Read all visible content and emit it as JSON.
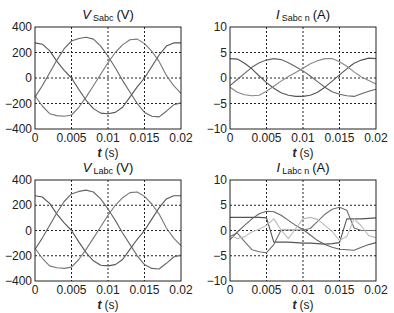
{
  "figure": {
    "width": 394,
    "height": 313
  },
  "chart_data": [
    {
      "id": "vs",
      "type": "line",
      "title_main": "V",
      "title_sub": "Sabc",
      "title_unit": "(V)",
      "xlabel_var": "t",
      "xlabel_unit": "(s)",
      "ylabel": "",
      "xlim": [
        0,
        0.02
      ],
      "ylim": [
        -400,
        400
      ],
      "xticks": [
        0,
        0.005,
        0.01,
        0.015,
        0.02
      ],
      "xtick_labels": [
        "0",
        "0.005",
        "0.01",
        "0.015",
        "0.02"
      ],
      "yticks": [
        -400,
        -200,
        0,
        200,
        400
      ],
      "ytick_labels": [
        "−400",
        "−200",
        "0",
        "200",
        "400"
      ],
      "grid": true,
      "box": {
        "x0": 35,
        "y0": 27,
        "x1": 181,
        "y1": 129
      },
      "x": [
        0,
        0.001,
        0.002,
        0.003,
        0.004,
        0.005,
        0.006,
        0.007,
        0.008,
        0.009,
        0.01,
        0.011,
        0.012,
        0.013,
        0.014,
        0.015,
        0.016,
        0.017,
        0.018,
        0.019,
        0.02
      ],
      "series": [
        {
          "name": "phase a",
          "color": "#555555",
          "values": [
            275,
            265,
            215,
            130,
            60,
            0,
            -90,
            -175,
            -240,
            -275,
            -280,
            -270,
            -230,
            -150,
            -70,
            0,
            90,
            180,
            250,
            275,
            275
          ]
        },
        {
          "name": "phase b",
          "color": "#666666",
          "values": [
            -150,
            -60,
            40,
            140,
            230,
            290,
            310,
            320,
            305,
            250,
            170,
            80,
            -20,
            -110,
            -200,
            -270,
            -300,
            -305,
            -260,
            -210,
            -195
          ]
        },
        {
          "name": "phase c",
          "color": "#777777",
          "values": [
            -140,
            -220,
            -280,
            -295,
            -300,
            -290,
            -230,
            -150,
            -60,
            30,
            120,
            200,
            260,
            300,
            305,
            270,
            210,
            130,
            20,
            -60,
            -120
          ]
        }
      ]
    },
    {
      "id": "is",
      "type": "line",
      "title_main": "I",
      "title_sub": "Sabc n",
      "title_unit": "(A)",
      "xlabel_var": "t",
      "xlabel_unit": "(s)",
      "ylabel": "",
      "xlim": [
        0,
        0.02
      ],
      "ylim": [
        -10,
        10
      ],
      "xticks": [
        0,
        0.005,
        0.01,
        0.015,
        0.02
      ],
      "xtick_labels": [
        "0",
        "0.005",
        "0.01",
        "0.015",
        "0.02"
      ],
      "yticks": [
        -10,
        -5,
        0,
        5,
        10
      ],
      "ytick_labels": [
        "−10",
        "−5",
        "0",
        "5",
        "10"
      ],
      "grid": true,
      "box": {
        "x0": 230,
        "y0": 27,
        "x1": 376,
        "y1": 129
      },
      "x": [
        0,
        0.001,
        0.002,
        0.003,
        0.004,
        0.005,
        0.006,
        0.007,
        0.008,
        0.009,
        0.01,
        0.011,
        0.012,
        0.013,
        0.014,
        0.015,
        0.016,
        0.017,
        0.018,
        0.019,
        0.02
      ],
      "series": [
        {
          "name": "phase a",
          "color": "#555555",
          "values": [
            3.8,
            3.7,
            2.9,
            1.8,
            0.4,
            -0.9,
            -2.0,
            -2.9,
            -3.4,
            -3.6,
            -3.6,
            -3.4,
            -2.8,
            -1.8,
            -0.6,
            0.6,
            1.8,
            2.9,
            3.5,
            3.9,
            3.8
          ]
        },
        {
          "name": "phase b",
          "color": "#666666",
          "values": [
            -1.5,
            -0.3,
            0.9,
            2.1,
            3.0,
            3.5,
            3.8,
            3.6,
            3.0,
            2.2,
            1.4,
            0.4,
            -0.7,
            -1.8,
            -2.7,
            -3.2,
            -3.5,
            -3.6,
            -3.1,
            -2.6,
            -2.2
          ]
        },
        {
          "name": "phase c",
          "color": "#888888",
          "values": [
            -1.8,
            -2.8,
            -3.3,
            -3.5,
            -3.4,
            -2.6,
            -1.6,
            -0.6,
            0.3,
            1.1,
            1.9,
            2.8,
            3.4,
            3.8,
            3.8,
            3.2,
            2.3,
            1.2,
            0.2,
            -0.5,
            -1.2
          ]
        }
      ]
    },
    {
      "id": "vl",
      "type": "line",
      "title_main": "V",
      "title_sub": "Labc",
      "title_unit": "(V)",
      "xlabel_var": "t",
      "xlabel_unit": "(s)",
      "ylabel": "",
      "xlim": [
        0,
        0.02
      ],
      "ylim": [
        -400,
        400
      ],
      "xticks": [
        0,
        0.005,
        0.01,
        0.015,
        0.02
      ],
      "xtick_labels": [
        "0",
        "0.005",
        "0.01",
        "0.015",
        "0.02"
      ],
      "yticks": [
        -400,
        -200,
        0,
        200,
        400
      ],
      "ytick_labels": [
        "−400",
        "−200",
        "0",
        "200",
        "400"
      ],
      "grid": true,
      "box": {
        "x0": 35,
        "y0": 180,
        "x1": 181,
        "y1": 281
      },
      "x": [
        0,
        0.001,
        0.002,
        0.003,
        0.004,
        0.005,
        0.006,
        0.007,
        0.008,
        0.009,
        0.01,
        0.011,
        0.012,
        0.013,
        0.014,
        0.015,
        0.016,
        0.017,
        0.018,
        0.019,
        0.02
      ],
      "series": [
        {
          "name": "phase a",
          "color": "#555555",
          "values": [
            275,
            265,
            215,
            130,
            60,
            0,
            -90,
            -175,
            -240,
            -275,
            -280,
            -270,
            -230,
            -150,
            -70,
            0,
            90,
            180,
            250,
            275,
            275
          ]
        },
        {
          "name": "phase b",
          "color": "#666666",
          "values": [
            -150,
            -60,
            40,
            140,
            230,
            290,
            310,
            320,
            305,
            250,
            170,
            80,
            -20,
            -110,
            -200,
            -270,
            -300,
            -305,
            -260,
            -210,
            -195
          ]
        },
        {
          "name": "phase c",
          "color": "#777777",
          "values": [
            -140,
            -220,
            -280,
            -295,
            -300,
            -290,
            -230,
            -150,
            -60,
            30,
            120,
            200,
            260,
            300,
            305,
            270,
            210,
            130,
            20,
            -60,
            -120
          ]
        }
      ]
    },
    {
      "id": "il",
      "type": "line",
      "title_main": "I",
      "title_sub": "Labc n",
      "title_unit": "(A)",
      "xlabel_var": "t",
      "xlabel_unit": "(s)",
      "ylabel": "",
      "xlim": [
        0,
        0.02
      ],
      "ylim": [
        -10,
        10
      ],
      "xticks": [
        0,
        0.005,
        0.01,
        0.015,
        0.02
      ],
      "xtick_labels": [
        "0",
        "0.005",
        "0.01",
        "0.015",
        "0.02"
      ],
      "yticks": [
        -10,
        -5,
        0,
        5,
        10
      ],
      "ytick_labels": [
        "−10",
        "−5",
        "0",
        "5",
        "10"
      ],
      "grid": true,
      "box": {
        "x0": 230,
        "y0": 180,
        "x1": 376,
        "y1": 281
      },
      "x": [
        0,
        0.001,
        0.002,
        0.003,
        0.004,
        0.005,
        0.006,
        0.007,
        0.008,
        0.009,
        0.01,
        0.011,
        0.012,
        0.013,
        0.014,
        0.015,
        0.016,
        0.017,
        0.018,
        0.019,
        0.02
      ],
      "series": [
        {
          "name": "phase a",
          "color": "#555555",
          "values": [
            2.6,
            2.6,
            2.6,
            2.6,
            2.6,
            2.5,
            -2.3,
            -2.3,
            -2.3,
            -2.4,
            -2.5,
            -2.5,
            -2.6,
            -2.7,
            -2.6,
            -2.4,
            2.3,
            2.3,
            2.3,
            2.4,
            2.5
          ]
        },
        {
          "name": "phase b",
          "color": "#666666",
          "values": [
            -1.8,
            -0.3,
            1.0,
            2.3,
            3.3,
            3.8,
            3.7,
            3.0,
            2.0,
            1.0,
            0.2,
            -0.9,
            -2.0,
            -2.8,
            -3.3,
            -3.7,
            -3.8,
            -3.9,
            -3.3,
            -2.8,
            -2.4
          ]
        },
        {
          "name": "phase c",
          "color": "#707070",
          "values": [
            -1.2,
            -0.5,
            -2.2,
            -3.8,
            -4.2,
            -4.4,
            -2.8,
            0.1,
            0.1,
            0.1,
            0.1,
            0.4,
            1.8,
            3.2,
            4.2,
            4.6,
            4.0,
            0.5,
            0.0,
            0.0,
            0.0
          ]
        },
        {
          "name": "neutral-ish light",
          "color": "#bbbbbb",
          "values": [
            -1.0,
            -1.6,
            -1.2,
            -0.3,
            0.3,
            1.0,
            2.3,
            0.1,
            -1.6,
            0.4,
            2.3,
            2.6,
            2.2,
            1.0,
            -0.2,
            -2.0,
            -1.2,
            2.3,
            0.9,
            -1.0,
            -1.4
          ]
        }
      ]
    }
  ]
}
